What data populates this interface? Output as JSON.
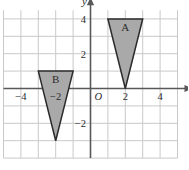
{
  "figure": {
    "origin_label": "O",
    "x_axis_label": "x",
    "y_axis_label": "y"
  },
  "colors": {
    "grid_line": "#c9c9c9",
    "axis_line": "#58585a",
    "shape_fill": "#a9a9a9",
    "shape_stroke": "#2b2b2b",
    "label_text": "#2b2b2b",
    "background": "#ffffff"
  },
  "chart_data": {
    "type": "scatter",
    "title": "",
    "xlabel": "x",
    "ylabel": "y",
    "grid": true,
    "legend": "none",
    "xlim": [
      -5,
      5
    ],
    "ylim": [
      -4,
      4.5
    ],
    "x_ticks": [
      -4,
      -2,
      2,
      4
    ],
    "x_tick_labels": [
      "−4",
      "−2",
      "2",
      "4"
    ],
    "y_ticks": [
      4,
      2,
      -2
    ],
    "y_tick_labels": [
      "4",
      "2",
      "−2"
    ],
    "grid_step": 1,
    "shapes": [
      {
        "name": "A",
        "label": "A",
        "type": "triangle",
        "vertices": [
          [
            1,
            4
          ],
          [
            3,
            4
          ],
          [
            2,
            0
          ]
        ],
        "label_position": [
          2,
          3.45
        ]
      },
      {
        "name": "B",
        "label": "B",
        "type": "triangle",
        "vertices": [
          [
            -3,
            1
          ],
          [
            -1,
            1
          ],
          [
            -2,
            -3
          ]
        ],
        "label_position": [
          -2,
          0.45
        ]
      }
    ]
  }
}
